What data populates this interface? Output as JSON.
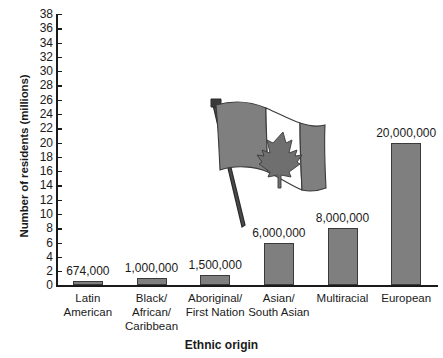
{
  "chart_data": {
    "type": "bar",
    "title": "",
    "xlabel": "Ethnic origin",
    "ylabel": "Number of residents (millions)",
    "ylim": [
      0,
      38
    ],
    "ytick_step": 2,
    "yticks": [
      0,
      2,
      4,
      6,
      8,
      10,
      12,
      14,
      16,
      18,
      20,
      22,
      24,
      26,
      28,
      30,
      32,
      34,
      36,
      38
    ],
    "grid": false,
    "legend": "none",
    "units": "millions of residents",
    "categories": [
      "Latin\nAmerican",
      "Black/\nAfrican/\nCaribbean",
      "Aboriginal/\nFirst Nation",
      "Asian/\nSouth Asian",
      "Multiracial",
      "European"
    ],
    "values": [
      0.674,
      1.0,
      1.5,
      6.0,
      8.0,
      20.0
    ],
    "data_labels": [
      "674,000",
      "1,000,000",
      "1,500,000",
      "6,000,000",
      "8,000,000",
      "20,000,000"
    ]
  },
  "illustration": {
    "name": "canadian-flag",
    "description": "Waving Canadian flag on a pole with maple leaf"
  },
  "colors": {
    "bar_fill": "#7f7f7f",
    "bar_stroke": "#3a3a3a",
    "axis": "#1a1a1a",
    "text": "#1a1a1a",
    "background": "#ffffff"
  }
}
